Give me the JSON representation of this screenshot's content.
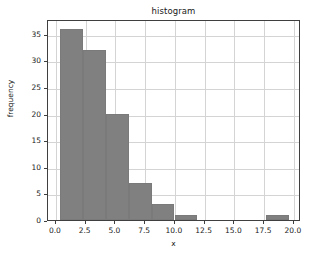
{
  "chart_data": {
    "type": "bar",
    "title": "histogram",
    "xlabel": "x",
    "ylabel": "frequency",
    "grid": true,
    "legend": false,
    "xlim": [
      -0.66,
      20.6
    ],
    "ylim": [
      0,
      37.8
    ],
    "xticks": [
      0.0,
      2.5,
      5.0,
      7.5,
      10.0,
      12.5,
      15.0,
      17.5,
      20.0
    ],
    "xticklabels": [
      "0.0",
      "2.5",
      "5.0",
      "7.5",
      "10.0",
      "12.5",
      "15.0",
      "17.5",
      "20.0"
    ],
    "yticks": [
      0,
      5,
      10,
      15,
      20,
      25,
      30,
      35
    ],
    "yticklabels": [
      "0",
      "5",
      "10",
      "15",
      "20",
      "25",
      "30",
      "35"
    ],
    "bin_edges": [
      0.33,
      2.26,
      4.19,
      6.11,
      8.04,
      9.97,
      11.9,
      13.82,
      15.75,
      17.68,
      19.61
    ],
    "values": [
      36,
      32,
      20,
      7,
      3,
      1,
      0,
      0,
      0,
      1
    ],
    "bar_color": "#808080",
    "grid_color": "#d4d4d4",
    "axes_color": "#3f3f3f",
    "background": "#ffffff"
  }
}
